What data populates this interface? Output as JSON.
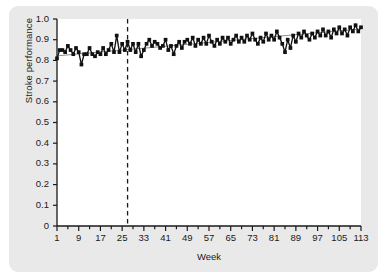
{
  "figure": {
    "background_color": "#e9e9e9",
    "panel_color": "#ffffff",
    "series_color": "#111111",
    "trend_color": "#8d8d8d",
    "reference_line_color": "#1a1a1a"
  },
  "axis": {
    "ylabel": "Stroke performance",
    "xlabel": "Week",
    "yticks": [
      "1.0",
      "0.9",
      "0.8",
      "0.7",
      "0.6",
      "0.5",
      "0.4",
      "0.3",
      "0.2",
      "0.1",
      "0"
    ],
    "xticks": [
      "1",
      "9",
      "17",
      "25",
      "33",
      "41",
      "49",
      "57",
      "65",
      "73",
      "81",
      "89",
      "97",
      "105",
      "113"
    ]
  },
  "chart_data": {
    "type": "line",
    "title": "",
    "subtitle": "",
    "xlabel": "Week",
    "ylabel": "Stroke performance",
    "xlim": [
      1,
      113
    ],
    "ylim": [
      0,
      1.0
    ],
    "ytick_values": [
      0,
      0.1,
      0.2,
      0.3,
      0.4,
      0.5,
      0.6,
      0.7,
      0.8,
      0.9,
      1.0
    ],
    "xtick_values": [
      1,
      9,
      17,
      25,
      33,
      41,
      49,
      57,
      65,
      73,
      81,
      89,
      97,
      105,
      113
    ],
    "minor_xtick_interval": 4,
    "grid": false,
    "legend": null,
    "markers": "filled-square",
    "annotations": [
      {
        "type": "vertical-dashed-line",
        "x": 27,
        "label": ""
      }
    ],
    "series": [
      {
        "name": "Stroke performance",
        "x": [
          1,
          2,
          3,
          4,
          5,
          6,
          7,
          8,
          9,
          10,
          11,
          12,
          13,
          14,
          15,
          16,
          17,
          18,
          19,
          20,
          21,
          22,
          23,
          24,
          25,
          26,
          27,
          28,
          29,
          30,
          31,
          32,
          33,
          34,
          35,
          36,
          37,
          38,
          39,
          40,
          41,
          42,
          43,
          44,
          45,
          46,
          47,
          48,
          49,
          50,
          51,
          52,
          53,
          54,
          55,
          56,
          57,
          58,
          59,
          60,
          61,
          62,
          63,
          64,
          65,
          66,
          67,
          68,
          69,
          70,
          71,
          72,
          73,
          74,
          75,
          76,
          77,
          78,
          79,
          80,
          81,
          82,
          83,
          84,
          85,
          86,
          87,
          88,
          89,
          90,
          91,
          92,
          93,
          94,
          95,
          96,
          97,
          98,
          99,
          100,
          101,
          102,
          103,
          104,
          105,
          106,
          107,
          108,
          109,
          110,
          111,
          112,
          113
        ],
        "y": [
          0.81,
          0.85,
          0.85,
          0.84,
          0.87,
          0.85,
          0.83,
          0.86,
          0.84,
          0.78,
          0.83,
          0.83,
          0.86,
          0.83,
          0.82,
          0.84,
          0.83,
          0.86,
          0.83,
          0.85,
          0.88,
          0.84,
          0.92,
          0.84,
          0.88,
          0.85,
          0.89,
          0.85,
          0.88,
          0.84,
          0.88,
          0.82,
          0.85,
          0.88,
          0.9,
          0.87,
          0.89,
          0.88,
          0.86,
          0.87,
          0.9,
          0.85,
          0.87,
          0.83,
          0.87,
          0.89,
          0.86,
          0.89,
          0.9,
          0.88,
          0.91,
          0.87,
          0.9,
          0.88,
          0.91,
          0.88,
          0.92,
          0.89,
          0.87,
          0.9,
          0.88,
          0.91,
          0.89,
          0.91,
          0.88,
          0.9,
          0.92,
          0.89,
          0.91,
          0.89,
          0.92,
          0.9,
          0.93,
          0.9,
          0.88,
          0.91,
          0.89,
          0.93,
          0.9,
          0.92,
          0.9,
          0.94,
          0.91,
          0.88,
          0.84,
          0.9,
          0.86,
          0.92,
          0.89,
          0.93,
          0.91,
          0.94,
          0.92,
          0.9,
          0.93,
          0.91,
          0.94,
          0.92,
          0.95,
          0.92,
          0.94,
          0.91,
          0.95,
          0.93,
          0.96,
          0.93,
          0.95,
          0.92,
          0.96,
          0.94,
          0.97,
          0.94,
          0.96
        ],
        "style": "line-with-markers",
        "color": "#111111"
      },
      {
        "name": "trend",
        "x": [
          1,
          113
        ],
        "y": [
          0.822,
          0.952
        ],
        "style": "thin-line",
        "color": "#8d8d8d"
      }
    ]
  }
}
